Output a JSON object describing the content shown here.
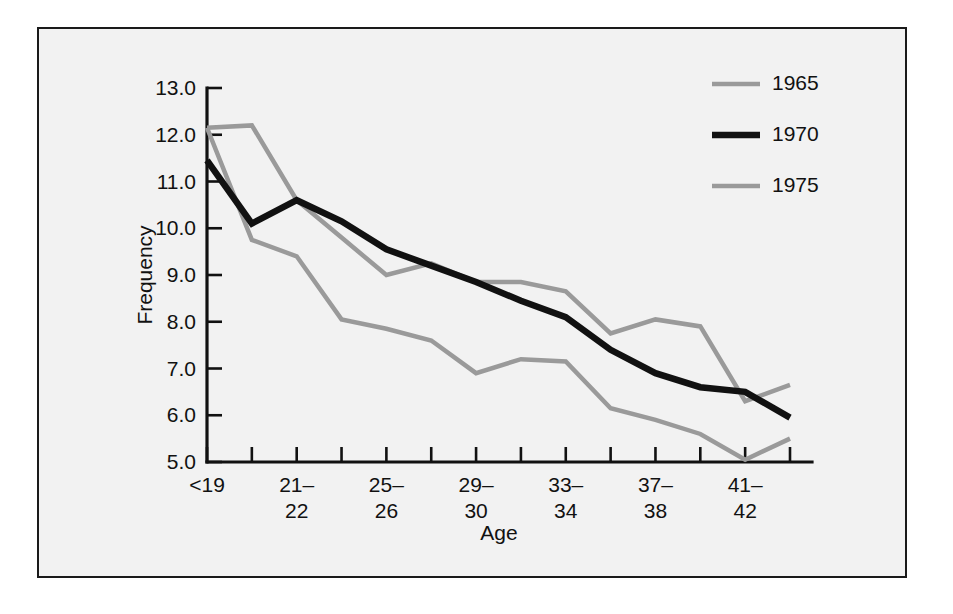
{
  "figure": {
    "background_color": "#f2f2f2",
    "frame_color": "#1a1a1a",
    "axis_color": "#111111"
  },
  "chart_data": {
    "type": "line",
    "title": "",
    "subtitle": "",
    "xlabel": "Age",
    "ylabel": "Frequency",
    "ylim": [
      5.0,
      13.0
    ],
    "ytick_labels": [
      "13.0",
      "12.0",
      "11.0",
      "10.0",
      "9.0",
      "8.0",
      "7.0",
      "6.0",
      "5.0"
    ],
    "ytick_values": [
      13.0,
      12.0,
      11.0,
      10.0,
      9.0,
      8.0,
      7.0,
      6.0,
      5.0
    ],
    "grid": false,
    "legend_position": "top-right",
    "x_tick_count": 14,
    "x_labeled_ticks": [
      {
        "index": 0,
        "line1": "<19",
        "line2": ""
      },
      {
        "index": 2,
        "line1": "21–",
        "line2": "22"
      },
      {
        "index": 4,
        "line1": "25–",
        "line2": "26"
      },
      {
        "index": 6,
        "line1": "29–",
        "line2": "30"
      },
      {
        "index": 8,
        "line1": "33–",
        "line2": "34"
      },
      {
        "index": 10,
        "line1": "37–",
        "line2": "38"
      },
      {
        "index": 12,
        "line1": "41–",
        "line2": "42"
      }
    ],
    "x": [
      0,
      1,
      2,
      3,
      4,
      5,
      6,
      7,
      8,
      9,
      10,
      11,
      12,
      13
    ],
    "series": [
      {
        "name": "1965",
        "color": "#9a9a9a",
        "width": 4.5,
        "values": [
          12.15,
          12.2,
          10.6,
          9.8,
          9.0,
          9.25,
          8.85,
          8.85,
          8.65,
          7.75,
          8.05,
          7.9,
          6.3,
          6.65
        ]
      },
      {
        "name": "1970",
        "color": "#111111",
        "width": 6.5,
        "values": [
          11.45,
          10.1,
          10.6,
          10.15,
          9.55,
          9.2,
          8.85,
          8.45,
          8.1,
          7.4,
          6.9,
          6.6,
          6.5,
          5.95
        ]
      },
      {
        "name": "1975",
        "color": "#9a9a9a",
        "width": 4.5,
        "values": [
          12.15,
          9.75,
          9.4,
          8.05,
          7.85,
          7.6,
          6.9,
          7.2,
          7.15,
          6.15,
          5.9,
          5.6,
          5.05,
          5.5
        ]
      }
    ]
  },
  "legend": {
    "entries": [
      {
        "label": "1965",
        "color": "#9a9a9a"
      },
      {
        "label": "1970",
        "color": "#111111"
      },
      {
        "label": "1975",
        "color": "#9a9a9a"
      }
    ]
  }
}
